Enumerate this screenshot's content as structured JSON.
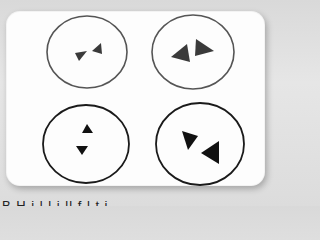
{
  "image": {
    "description": "Printed card showing four circles, each containing a pair of triangles",
    "colors": {
      "background": "#dedede",
      "card": "#fdfdfd",
      "circle_stroke_light": "#555555",
      "circle_stroke_dark": "#1a1a1a",
      "triangle_light": "#3a3a3a",
      "triangle_dark": "#111111"
    },
    "circles": [
      {
        "position": "top-left",
        "size": "small triangles",
        "arrangement": "pointing toward each other horizontally"
      },
      {
        "position": "top-right",
        "size": "large triangles",
        "arrangement": "side by side, pointing left/right"
      },
      {
        "position": "bottom-left",
        "size": "small triangles",
        "arrangement": "stacked vertically, up and down"
      },
      {
        "position": "bottom-right",
        "size": "large triangles",
        "arrangement": "diagonal, pointing toward each other"
      }
    ],
    "caption": "B  H      i l l i          ll  f  l    t       i    "
  }
}
